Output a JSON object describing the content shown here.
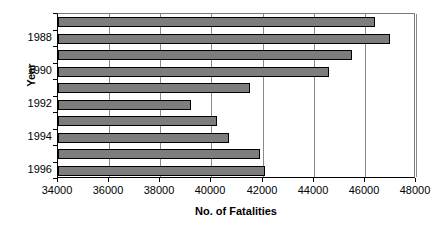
{
  "chart_data": {
    "type": "bar",
    "orientation": "horizontal",
    "title": "",
    "xlabel": "No. of Fatalities",
    "ylabel": "Year",
    "xlim": [
      34000,
      48000
    ],
    "xticks": [
      34000,
      36000,
      38000,
      40000,
      42000,
      44000,
      46000,
      48000
    ],
    "xtick_labels": [
      "34000",
      "36000",
      "38000",
      "40000",
      "42000",
      "44000",
      "46000",
      "48000"
    ],
    "grid": true,
    "grid_axis": "x",
    "legend": null,
    "categories": [
      "1987",
      "1988",
      "1989",
      "1990",
      "1991",
      "1992",
      "1993",
      "1994",
      "1995",
      "1996"
    ],
    "ytick_labels": [
      "1988",
      "1990",
      "1992",
      "1994",
      "1996"
    ],
    "values": [
      46400,
      47000,
      45500,
      44600,
      41500,
      39200,
      40200,
      40700,
      41900,
      42100
    ],
    "bar_color": "#7d7d7d",
    "bar_border_color": "#000000",
    "axis_color": "#000000",
    "grid_color": "#8a8a8a",
    "background": "#ffffff"
  }
}
